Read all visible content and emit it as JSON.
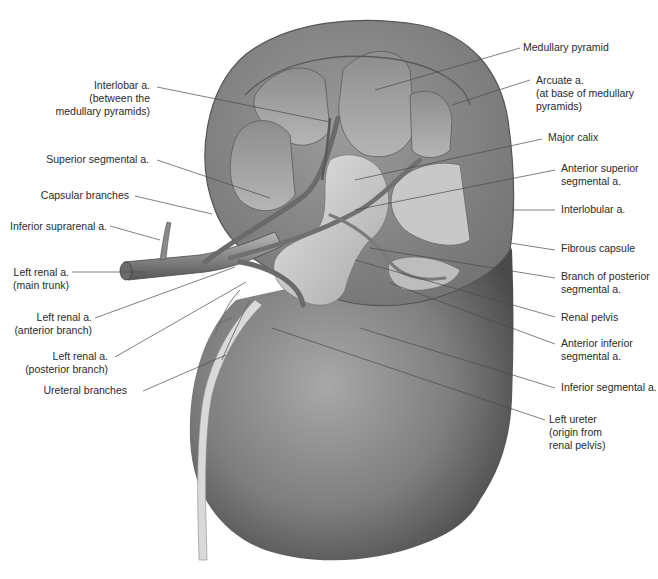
{
  "figure": {
    "colors": {
      "ink": "#2a2a2a",
      "leader": "#4a4a4a",
      "tissue_dark": "#555555",
      "tissue_mid": "#8a8a8a",
      "tissue_light": "#c9c9c9"
    }
  },
  "labels": {
    "left": [
      {
        "id": "interlobar",
        "lines": [
          "Interlobar a.",
          "(between the",
          "medullary pyramids)"
        ]
      },
      {
        "id": "superior_segmental",
        "lines": [
          "Superior segmental a."
        ]
      },
      {
        "id": "capsular_branches",
        "lines": [
          "Capsular branches"
        ]
      },
      {
        "id": "inferior_suprarenal",
        "lines": [
          "Inferior suprarenal a."
        ]
      },
      {
        "id": "renal_main",
        "lines": [
          "Left renal a.",
          "(main trunk)"
        ]
      },
      {
        "id": "renal_anterior",
        "lines": [
          "Left renal a.",
          "(anterior branch)"
        ]
      },
      {
        "id": "renal_posterior",
        "lines": [
          "Left renal a.",
          "(posterior branch)"
        ]
      },
      {
        "id": "ureteral_branches",
        "lines": [
          "Ureteral branches"
        ]
      }
    ],
    "right": [
      {
        "id": "medullary_pyramid",
        "lines": [
          "Medullary pyramid"
        ]
      },
      {
        "id": "arcuate",
        "lines": [
          "Arcuate a.",
          "(at base of medullary",
          "pyramids)"
        ]
      },
      {
        "id": "major_calix",
        "lines": [
          "Major calix"
        ]
      },
      {
        "id": "anterior_superior",
        "lines": [
          "Anterior superior",
          "segmental a."
        ]
      },
      {
        "id": "interlobular",
        "lines": [
          "Interlobular a."
        ]
      },
      {
        "id": "fibrous_capsule",
        "lines": [
          "Fibrous capsule"
        ]
      },
      {
        "id": "branch_posterior",
        "lines": [
          "Branch of posterior",
          "segmental a."
        ]
      },
      {
        "id": "renal_pelvis",
        "lines": [
          "Renal pelvis"
        ]
      },
      {
        "id": "anterior_inferior",
        "lines": [
          "Anterior inferior",
          "segmental a."
        ]
      },
      {
        "id": "inferior_segmental",
        "lines": [
          "Inferior segmental a."
        ]
      },
      {
        "id": "left_ureter",
        "lines": [
          "Left ureter",
          "(origin from",
          "renal pelvis)"
        ]
      }
    ]
  }
}
